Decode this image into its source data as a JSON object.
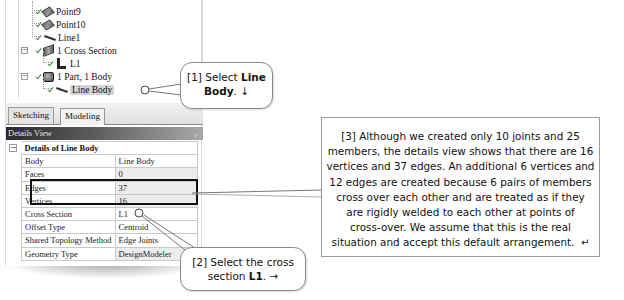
{
  "tree": {
    "items": [
      {
        "label": "Point9",
        "icon": "point-icon"
      },
      {
        "label": "Point10",
        "icon": "point-icon"
      },
      {
        "label": "Line1",
        "icon": "line-icon"
      },
      {
        "label": "1 Cross Section",
        "icon": "cross-section-icon",
        "expander": "−"
      },
      {
        "label": "L1",
        "icon": "l-section-icon"
      },
      {
        "label": "1 Part, 1 Body",
        "icon": "part-icon",
        "expander": "−"
      },
      {
        "label": "Line Body",
        "icon": "line-body-icon",
        "selected": true
      }
    ]
  },
  "tabs": [
    {
      "label": "Sketching",
      "active": false
    },
    {
      "label": "Modeling",
      "active": true
    }
  ],
  "details": {
    "header": "Details View",
    "pin_glyph": "ᵩ",
    "group_expander": "−",
    "group_title": "Details of Line Body",
    "rows": [
      {
        "key": "Body",
        "value": "Line Body"
      },
      {
        "key": "Faces",
        "value": "0"
      },
      {
        "key": "Edges",
        "value": "37"
      },
      {
        "key": "Vertices",
        "value": "16"
      },
      {
        "key": "Cross Section",
        "value": "L1"
      },
      {
        "key": "Offset Type",
        "value": "Centroid"
      },
      {
        "key": "Shared Topology Method",
        "value": "Edge Joints"
      },
      {
        "key": "Geometry Type",
        "value": "DesignModeler"
      }
    ]
  },
  "callouts": {
    "c1": {
      "prefix": "[1] Select ",
      "bold1": "Line",
      "bold2": "Body",
      "suffix": ". ↓"
    },
    "c2": {
      "line1": "[2] Select the cross",
      "prefix2": "section ",
      "bold": "L1",
      "suffix": ". →"
    },
    "c3": {
      "lines": [
        "[3] Although we created only 10 joints and 25",
        "members, the details view shows that there are 16",
        "vertices and 37 edges.  An additional 6 vertices and",
        "12 edges are created because 6 pairs of members",
        "cross over each other and are treated as if they",
        "are rigidly welded to each other at points of",
        "cross-over. We assume that this is the real",
        "situation and accept this default arrangement."
      ],
      "end_glyph": "↵"
    }
  }
}
